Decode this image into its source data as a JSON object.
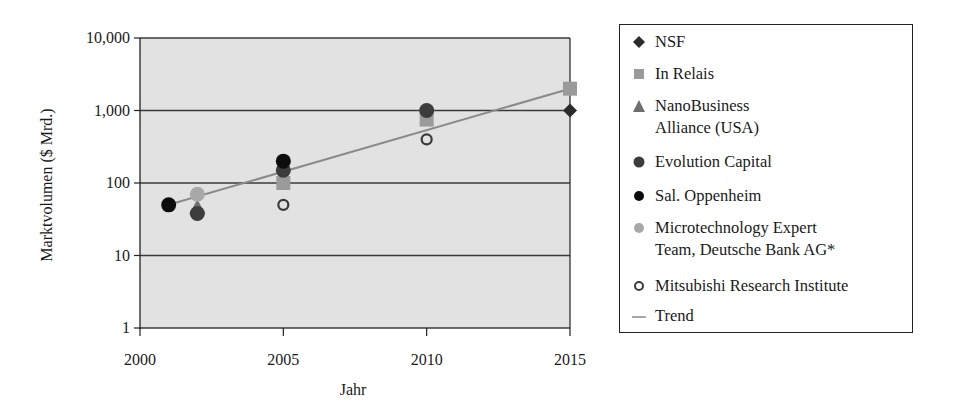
{
  "chart_data": {
    "type": "scatter",
    "title": "",
    "xlabel": "Jahr",
    "ylabel": "Marktvolumen ($ Mrd.)",
    "xlim": [
      2000,
      2015
    ],
    "ylim": [
      1,
      10000
    ],
    "yscale": "log",
    "x_ticks": [
      "2000",
      "2005",
      "2010",
      "2015"
    ],
    "y_ticks": [
      "1",
      "10",
      "100",
      "1,000",
      "10,000"
    ],
    "grid": "horizontal",
    "plot_background": "#e2e2e2",
    "legend_position": "right",
    "series": [
      {
        "name": "NSF",
        "marker": "diamond",
        "color": "#2b2b2b",
        "points": [
          [
            2015,
            1000
          ]
        ]
      },
      {
        "name": "In Relais",
        "marker": "square",
        "color": "#9a9a9a",
        "points": [
          [
            2005,
            100
          ],
          [
            2010,
            750
          ],
          [
            2015,
            2000
          ]
        ]
      },
      {
        "name": "NanoBusiness Alliance (USA)",
        "marker": "triangle",
        "color": "#6e6e6e",
        "points": [
          [
            2002,
            45
          ]
        ]
      },
      {
        "name": "Evolution Capital",
        "marker": "circle",
        "color": "#3c3c3c",
        "points": [
          [
            2002,
            38
          ],
          [
            2005,
            150
          ],
          [
            2010,
            1000
          ]
        ]
      },
      {
        "name": "Sal. Oppenheim",
        "marker": "circle",
        "color": "#0d0d0d",
        "points": [
          [
            2001,
            50
          ],
          [
            2005,
            200
          ]
        ]
      },
      {
        "name": "Microtechnology Expert Team, Deutsche Bank AG*",
        "marker": "circle",
        "color": "#a8a8a8",
        "points": [
          [
            2002,
            70
          ]
        ]
      },
      {
        "name": "Mitsubishi Research Institute",
        "marker": "open-circle",
        "color": "#3a3a3a",
        "points": [
          [
            2005,
            50
          ],
          [
            2010,
            400
          ]
        ]
      },
      {
        "name": "Trend",
        "marker": "line",
        "color": "#8a8a8a",
        "points": [
          [
            2001,
            50
          ],
          [
            2015,
            2000
          ]
        ]
      }
    ]
  },
  "axes": {
    "xlabel": "Jahr",
    "ylabel": "Marktvolumen ($ Mrd.)",
    "y_tick_labels": [
      "10,000",
      "1,000",
      "100",
      "10",
      "1"
    ],
    "x_tick_labels": [
      "2000",
      "2005",
      "2010",
      "2015"
    ]
  },
  "legend": {
    "items": [
      {
        "label": "NSF",
        "icon": "diamond-marker-icon"
      },
      {
        "label": "In Relais",
        "icon": "square-marker-icon"
      },
      {
        "label": "NanoBusiness\nAlliance (USA)",
        "icon": "triangle-marker-icon"
      },
      {
        "label": "Evolution Capital",
        "icon": "dark-gray-circle-marker-icon"
      },
      {
        "label": "Sal. Oppenheim",
        "icon": "black-circle-marker-icon"
      },
      {
        "label": "Microtechnology Expert\nTeam, Deutsche Bank AG*",
        "icon": "light-gray-circle-marker-icon"
      },
      {
        "label": "Mitsubishi Research Institute",
        "icon": "open-circle-marker-icon"
      },
      {
        "label": "Trend",
        "icon": "line-marker-icon"
      }
    ]
  }
}
